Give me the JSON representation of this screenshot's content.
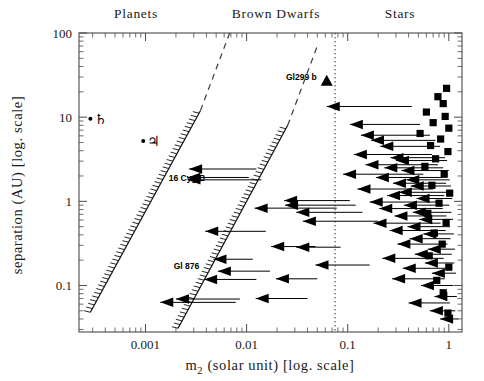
{
  "figure": {
    "title_top_labels": [
      {
        "name": "planets",
        "text": "Planets",
        "x": 136,
        "y": 18
      },
      {
        "name": "brown-dwarfs",
        "text": "Brown Dwarfs",
        "x": 276,
        "y": 18
      },
      {
        "name": "stars",
        "text": "Stars",
        "x": 400,
        "y": 18
      }
    ],
    "xlabel": "m₂ (solar unit) [log. scale]",
    "xlabel_main": "m",
    "xlabel_sub": "2",
    "xlabel_rest": " (solar unit) [log. scale]",
    "ylabel": "separation (AU) [log. scale]"
  },
  "chart_data": {
    "type": "scatter",
    "title": "",
    "xlabel": "m_2 (solar unit) [log. scale]",
    "ylabel": "separation (AU) [log. scale]",
    "xscale": "log",
    "yscale": "log",
    "xlim": [
      0.00022,
      1.35
    ],
    "ylim": [
      0.028,
      100
    ],
    "grid": false,
    "legend": null,
    "region_labels": [
      "Planets",
      "Brown Dwarfs",
      "Stars"
    ],
    "xticks": [
      0.001,
      0.01,
      0.1,
      1
    ],
    "xticklabels": [
      "0.001",
      "0.01",
      "0.1",
      "1"
    ],
    "yticks": [
      0.1,
      1,
      10,
      100
    ],
    "yticklabels": [
      "0.1",
      "1",
      "10",
      "100"
    ],
    "annotations": [
      {
        "label": "♄",
        "name": "saturn-symbol",
        "x": 0.000285,
        "y": 9.55,
        "marker": "dot+glyph"
      },
      {
        "label": "♃",
        "name": "jupiter-symbol",
        "x": 0.00095,
        "y": 5.2,
        "marker": "dot+glyph"
      },
      {
        "label": "16 Cyg B",
        "name": "label-16-cyg-b",
        "x": 0.0017,
        "y": 1.72,
        "marker": "text"
      },
      {
        "label": "Gl 876",
        "name": "label-gl-876",
        "x": 0.0019,
        "y": 0.155,
        "marker": "text"
      },
      {
        "label": "Gl299 b",
        "name": "label-gl299b",
        "x": 0.062,
        "y": 27.0,
        "marker": "triangle"
      }
    ],
    "vertical_line": {
      "name": "hydrogen-burning-limit",
      "x": 0.075,
      "style": "dotted"
    },
    "diagonal_bands": [
      {
        "name": "band-left",
        "x0": 0.000285,
        "y0": 0.048,
        "x1": 0.0035,
        "y1": 12.0,
        "hatched": true
      },
      {
        "name": "band-left-dashed",
        "x0": 0.0035,
        "y0": 12.0,
        "x1": 0.0068,
        "y1": 100,
        "hatched": false
      },
      {
        "name": "band-right",
        "x0": 0.0021,
        "y0": 0.031,
        "x1": 0.0255,
        "y1": 8.0,
        "hatched": true
      },
      {
        "name": "band-right-dashed",
        "x0": 0.0255,
        "y0": 8.0,
        "x1": 0.05,
        "y1": 70.0,
        "hatched": false
      }
    ],
    "series": [
      {
        "name": "companions-upper-limits",
        "marker": "left-triangle-with-rightward-bar",
        "points": [
          {
            "x": 0.0027,
            "y": 2.42,
            "bar_to": 0.0125
          },
          {
            "x": 0.0026,
            "y": 1.92,
            "bar_to": 0.0105
          },
          {
            "x": 0.0026,
            "y": 1.8,
            "bar_to": 0.014
          },
          {
            "x": 0.0039,
            "y": 0.44,
            "bar_to": 0.0155
          },
          {
            "x": 0.0047,
            "y": 0.205,
            "bar_to": 0.0115
          },
          {
            "x": 0.0052,
            "y": 0.148,
            "bar_to": 0.017
          },
          {
            "x": 0.0038,
            "y": 0.118,
            "bar_to": 0.0125
          },
          {
            "x": 0.002,
            "y": 0.069,
            "bar_to": 0.0086
          },
          {
            "x": 0.0014,
            "y": 0.063,
            "bar_to": 0.0078
          },
          {
            "x": 0.0123,
            "y": 0.07,
            "bar_to": 0.04
          },
          {
            "x": 0.0175,
            "y": 0.29,
            "bar_to": 0.048
          },
          {
            "x": 0.0235,
            "y": 1.02,
            "bar_to": 0.105
          },
          {
            "x": 0.024,
            "y": 0.9,
            "bar_to": 0.12
          },
          {
            "x": 0.031,
            "y": 0.74,
            "bar_to": 0.14
          },
          {
            "x": 0.012,
            "y": 0.83,
            "bar_to": 0.078
          },
          {
            "x": 0.036,
            "y": 0.58,
            "bar_to": 0.2
          },
          {
            "x": 0.031,
            "y": 0.285,
            "bar_to": 0.085
          },
          {
            "x": 0.048,
            "y": 0.175,
            "bar_to": 0.165
          },
          {
            "x": 0.0195,
            "y": 0.12,
            "bar_to": 0.05
          },
          {
            "x": 0.062,
            "y": 13.4,
            "bar_to": 0.43
          },
          {
            "x": 0.105,
            "y": 8.2,
            "bar_to": 0.52
          },
          {
            "x": 0.135,
            "y": 6.1,
            "bar_to": 0.65
          },
          {
            "x": 0.17,
            "y": 5.3,
            "bar_to": 0.74
          },
          {
            "x": 0.21,
            "y": 4.5,
            "bar_to": 0.82
          },
          {
            "x": 0.115,
            "y": 3.6,
            "bar_to": 0.68
          },
          {
            "x": 0.265,
            "y": 3.3,
            "bar_to": 0.92
          },
          {
            "x": 0.3,
            "y": 3.05,
            "bar_to": 0.96
          },
          {
            "x": 0.15,
            "y": 2.72,
            "bar_to": 0.78
          },
          {
            "x": 0.23,
            "y": 2.5,
            "bar_to": 0.88
          },
          {
            "x": 0.34,
            "y": 2.32,
            "bar_to": 1.0
          },
          {
            "x": 0.09,
            "y": 2.1,
            "bar_to": 0.56
          },
          {
            "x": 0.19,
            "y": 1.92,
            "bar_to": 0.86
          },
          {
            "x": 0.38,
            "y": 1.8,
            "bar_to": 1.02
          },
          {
            "x": 0.28,
            "y": 1.64,
            "bar_to": 0.94
          },
          {
            "x": 0.42,
            "y": 1.52,
            "bar_to": 1.05
          },
          {
            "x": 0.125,
            "y": 1.4,
            "bar_to": 0.7
          },
          {
            "x": 0.32,
            "y": 1.28,
            "bar_to": 0.99
          },
          {
            "x": 0.245,
            "y": 1.17,
            "bar_to": 0.9
          },
          {
            "x": 0.48,
            "y": 1.08,
            "bar_to": 1.08
          },
          {
            "x": 0.165,
            "y": 0.98,
            "bar_to": 0.8
          },
          {
            "x": 0.36,
            "y": 0.9,
            "bar_to": 1.01
          },
          {
            "x": 0.205,
            "y": 0.82,
            "bar_to": 0.87
          },
          {
            "x": 0.44,
            "y": 0.74,
            "bar_to": 1.06
          },
          {
            "x": 0.29,
            "y": 0.67,
            "bar_to": 0.95
          },
          {
            "x": 0.51,
            "y": 0.61,
            "bar_to": 1.1
          },
          {
            "x": 0.18,
            "y": 0.55,
            "bar_to": 0.83
          },
          {
            "x": 0.39,
            "y": 0.5,
            "bar_to": 1.03
          },
          {
            "x": 0.26,
            "y": 0.45,
            "bar_to": 0.93
          },
          {
            "x": 0.56,
            "y": 0.41,
            "bar_to": 1.12
          },
          {
            "x": 0.41,
            "y": 0.36,
            "bar_to": 1.04
          },
          {
            "x": 0.31,
            "y": 0.31,
            "bar_to": 0.97
          },
          {
            "x": 0.62,
            "y": 0.27,
            "bar_to": 1.15
          },
          {
            "x": 0.46,
            "y": 0.235,
            "bar_to": 1.07
          },
          {
            "x": 0.22,
            "y": 0.21,
            "bar_to": 0.89
          },
          {
            "x": 0.58,
            "y": 0.185,
            "bar_to": 1.13
          },
          {
            "x": 0.35,
            "y": 0.16,
            "bar_to": 1.0
          },
          {
            "x": 0.68,
            "y": 0.14,
            "bar_to": 1.18
          },
          {
            "x": 0.275,
            "y": 0.12,
            "bar_to": 0.91
          },
          {
            "x": 0.53,
            "y": 0.1,
            "bar_to": 1.11
          },
          {
            "x": 0.72,
            "y": 0.074,
            "bar_to": 1.2
          },
          {
            "x": 0.4,
            "y": 0.062,
            "bar_to": 1.025
          },
          {
            "x": 0.65,
            "y": 0.05,
            "bar_to": 1.16
          },
          {
            "x": 0.82,
            "y": 0.04,
            "bar_to": 1.24
          }
        ]
      },
      {
        "name": "filled-squares",
        "marker": "square",
        "points": [
          {
            "x": 0.95,
            "y": 22.0
          },
          {
            "x": 0.78,
            "y": 17.5
          },
          {
            "x": 0.88,
            "y": 14.5
          },
          {
            "x": 0.6,
            "y": 11.5
          },
          {
            "x": 0.92,
            "y": 10.2
          },
          {
            "x": 0.7,
            "y": 8.6
          },
          {
            "x": 1.0,
            "y": 7.4
          },
          {
            "x": 0.52,
            "y": 6.4
          },
          {
            "x": 0.83,
            "y": 5.5
          },
          {
            "x": 0.66,
            "y": 4.6
          },
          {
            "x": 0.98,
            "y": 3.9
          },
          {
            "x": 0.74,
            "y": 3.2
          },
          {
            "x": 0.58,
            "y": 2.6
          },
          {
            "x": 0.9,
            "y": 2.1
          },
          {
            "x": 0.68,
            "y": 1.55
          },
          {
            "x": 1.02,
            "y": 1.25
          },
          {
            "x": 0.8,
            "y": 0.95
          },
          {
            "x": 0.62,
            "y": 0.72
          },
          {
            "x": 0.94,
            "y": 0.56
          },
          {
            "x": 0.72,
            "y": 0.42
          },
          {
            "x": 0.86,
            "y": 0.31
          },
          {
            "x": 0.64,
            "y": 0.225
          },
          {
            "x": 1.0,
            "y": 0.165
          },
          {
            "x": 0.76,
            "y": 0.115
          },
          {
            "x": 0.88,
            "y": 0.082
          },
          {
            "x": 0.98,
            "y": 0.047
          }
        ]
      }
    ]
  }
}
